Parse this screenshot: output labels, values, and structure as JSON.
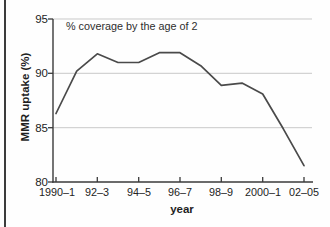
{
  "page": {
    "background": "#fefefe",
    "page_edge_color": "#3c3c3c"
  },
  "chart_data": {
    "type": "line",
    "title": "",
    "annotation": "% coverage by the age of 2",
    "xlabel": "year",
    "ylabel": "MMR uptake (%)",
    "ylim": [
      80,
      95
    ],
    "y_ticks": [
      95,
      90,
      85,
      80
    ],
    "y_tick_labels": [
      "95",
      "90",
      "85",
      "80"
    ],
    "x_tick_labels": [
      "1990–1",
      "92–3",
      "94–5",
      "96–7",
      "98–9",
      "2000–1",
      "02–05"
    ],
    "grid": "horizontal-light",
    "legend": "none",
    "colors": {
      "grid": "#c9c9c9",
      "axis": "#3a3a3a",
      "line": "#4a4a4a"
    },
    "series": [
      {
        "name": "MMR uptake by age 2",
        "color": "#4a4a4a",
        "x": [
          "1990–1",
          "1991–2",
          "1992–3",
          "1993–4",
          "1994–5",
          "1995–6",
          "1996–7",
          "1997–8",
          "1998–9",
          "1999–00",
          "2000–1",
          "2001–2",
          "2002–05"
        ],
        "values": [
          86.3,
          90.2,
          91.8,
          91.0,
          91.0,
          91.9,
          91.9,
          90.7,
          88.9,
          89.1,
          88.1,
          84.9,
          81.5
        ]
      }
    ]
  }
}
